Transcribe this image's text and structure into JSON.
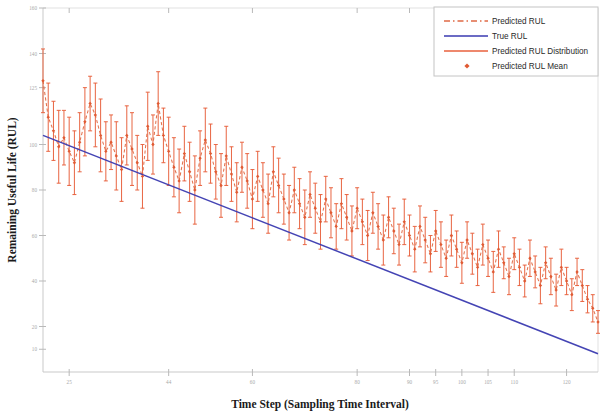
{
  "chart_data": {
    "type": "line",
    "title": "",
    "xlabel": "Time Step (Sampling Time Interval)",
    "ylabel": "Remaining Useful Life (RUL)",
    "xlim": [
      20,
      126
    ],
    "ylim": [
      0,
      160
    ],
    "grid": false,
    "legend_position": "top-right",
    "xticks": [
      25,
      44,
      60,
      80,
      90,
      95,
      100,
      105,
      110,
      120
    ],
    "xticklabels": [
      "25",
      "44",
      "60",
      "80",
      "90",
      "95",
      "100",
      "105",
      "110",
      "120"
    ],
    "yticks": [
      10,
      20,
      40,
      60,
      80,
      100,
      125,
      140,
      160
    ],
    "yticklabels": [
      "10",
      "20",
      "40",
      "60",
      "80",
      "100",
      "125",
      "140",
      "160"
    ],
    "series": [
      {
        "name": "True RUL",
        "type": "line",
        "color": "#3a3ab0",
        "style": "solid",
        "x": [
          20,
          126
        ],
        "values": [
          104,
          8
        ]
      },
      {
        "name": "Predicted RUL",
        "type": "line",
        "color": "#e06a45",
        "style": "dashed",
        "x": [
          20,
          21,
          22,
          23,
          24,
          25,
          26,
          27,
          28,
          29,
          30,
          31,
          32,
          33,
          34,
          35,
          36,
          37,
          38,
          39,
          40,
          41,
          42,
          43,
          44,
          45,
          46,
          47,
          48,
          49,
          50,
          51,
          52,
          53,
          54,
          55,
          56,
          57,
          58,
          59,
          60,
          61,
          62,
          63,
          64,
          65,
          66,
          67,
          68,
          69,
          70,
          71,
          72,
          73,
          74,
          75,
          76,
          77,
          78,
          79,
          80,
          81,
          82,
          83,
          84,
          85,
          86,
          87,
          88,
          89,
          90,
          91,
          92,
          93,
          94,
          95,
          96,
          97,
          98,
          99,
          100,
          101,
          102,
          103,
          104,
          105,
          106,
          107,
          108,
          109,
          110,
          111,
          112,
          113,
          114,
          115,
          116,
          117,
          118,
          119,
          120,
          121,
          122,
          123,
          124,
          125,
          126
        ],
        "values": [
          128,
          112,
          106,
          99,
          103,
          97,
          92,
          101,
          110,
          118,
          113,
          104,
          97,
          101,
          95,
          89,
          104,
          98,
          92,
          86,
          108,
          100,
          118,
          104,
          97,
          90,
          84,
          96,
          88,
          80,
          94,
          102,
          96,
          88,
          82,
          95,
          87,
          79,
          90,
          84,
          76,
          86,
          80,
          74,
          88,
          82,
          76,
          70,
          80,
          74,
          68,
          78,
          72,
          66,
          76,
          70,
          64,
          74,
          68,
          62,
          72,
          66,
          60,
          70,
          64,
          58,
          68,
          62,
          56,
          66,
          60,
          54,
          64,
          58,
          52,
          62,
          56,
          50,
          60,
          54,
          48,
          58,
          52,
          46,
          56,
          50,
          44,
          54,
          48,
          42,
          52,
          46,
          40,
          50,
          44,
          38,
          48,
          42,
          36,
          46,
          40,
          34,
          44,
          38,
          32,
          28,
          22
        ]
      },
      {
        "name": "Predicted RUL Distribution",
        "type": "errorbar",
        "color": "#e8603c",
        "x": [
          20,
          21,
          22,
          23,
          24,
          25,
          26,
          27,
          28,
          29,
          30,
          31,
          32,
          33,
          34,
          35,
          36,
          37,
          38,
          39,
          40,
          41,
          42,
          43,
          44,
          45,
          46,
          47,
          48,
          49,
          50,
          51,
          52,
          53,
          54,
          55,
          56,
          57,
          58,
          59,
          60,
          61,
          62,
          63,
          64,
          65,
          66,
          67,
          68,
          69,
          70,
          71,
          72,
          73,
          74,
          75,
          76,
          77,
          78,
          79,
          80,
          81,
          82,
          83,
          84,
          85,
          86,
          87,
          88,
          89,
          90,
          91,
          92,
          93,
          94,
          95,
          96,
          97,
          98,
          99,
          100,
          101,
          102,
          103,
          104,
          105,
          106,
          107,
          108,
          109,
          110,
          111,
          112,
          113,
          114,
          115,
          116,
          117,
          118,
          119,
          120,
          121,
          122,
          123,
          124,
          125,
          126
        ],
        "errors": [
          14,
          15,
          13,
          16,
          12,
          15,
          14,
          13,
          15,
          12,
          14,
          16,
          13,
          12,
          15,
          14,
          13,
          16,
          12,
          14,
          15,
          13,
          14,
          12,
          15,
          13,
          14,
          12,
          13,
          15,
          12,
          14,
          13,
          12,
          14,
          13,
          12,
          13,
          11,
          12,
          13,
          11,
          12,
          13,
          11,
          12,
          11,
          12,
          10,
          11,
          12,
          10,
          11,
          12,
          10,
          11,
          10,
          11,
          10,
          11,
          9,
          10,
          11,
          9,
          10,
          11,
          9,
          10,
          9,
          10,
          9,
          10,
          9,
          10,
          8,
          9,
          10,
          8,
          9,
          8,
          9,
          8,
          9,
          8,
          9,
          8,
          9,
          8,
          7,
          8,
          7,
          8,
          7,
          8,
          7,
          8,
          7,
          8,
          7,
          8,
          6,
          7,
          6,
          7,
          6,
          6,
          5
        ]
      },
      {
        "name": "Predicted RUL Mean",
        "type": "marker",
        "color": "#e05a33",
        "marker": "diamond"
      }
    ],
    "legend_entries": [
      {
        "label": "Predicted RUL",
        "color": "#e06a45",
        "style": "dashed-line"
      },
      {
        "label": "True RUL",
        "color": "#3a3ab0",
        "style": "solid-line"
      },
      {
        "label": "Predicted RUL Distribution",
        "color": "#e8603c",
        "style": "solid-line"
      },
      {
        "label": "Predicted RUL Mean",
        "color": "#e05a33",
        "style": "diamond-marker"
      }
    ]
  }
}
